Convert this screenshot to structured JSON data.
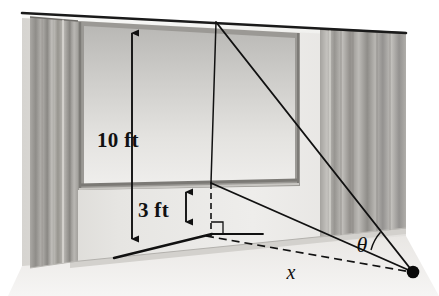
{
  "figure": {
    "background_color": "#ffffff",
    "width": 439,
    "height": 296
  },
  "labels": {
    "top_height": "10 ft",
    "bottom_height": "3 ft",
    "horizontal_distance": "x",
    "angle": "θ"
  },
  "colors": {
    "ink": "#111111",
    "wall_light": "#f1f0ee",
    "wall_mid": "#dcdad6",
    "screen_light": "#e8e7e4",
    "screen_dark": "#bcbbb8",
    "frame": "#8e8c88",
    "curtain_light": "#cdcbc7",
    "curtain_dark": "#9a9894",
    "floor": "#e4e2df",
    "baseboard": "#cfcdc9"
  },
  "geometry": {
    "ceiling_line": {
      "x1": 22,
      "y1": 13,
      "x2": 406,
      "y2": 33
    },
    "vertex_point": {
      "cx": 413,
      "cy": 272,
      "r": 6
    },
    "screen_top_point": {
      "x": 216,
      "y": 22
    },
    "screen_bottom_point": {
      "x": 211,
      "y": 183
    },
    "foot_point": {
      "x": 211,
      "y": 234
    },
    "height_arrow_10ft": {
      "x": 132,
      "y_top": 25,
      "y_bottom": 247
    },
    "height_arrow_3ft": {
      "x": 186,
      "y_top": 184,
      "y_bottom": 230
    },
    "right_angle_marker": {
      "x": 211,
      "y": 234,
      "size": 12
    },
    "angle_arc": {
      "cx": 413,
      "cy": 272,
      "r": 44
    }
  },
  "elements": {
    "left_curtain": {
      "x": 30,
      "y": 17,
      "w": 48,
      "h": 251
    },
    "right_curtain": {
      "x": 320,
      "y": 29,
      "w": 85,
      "h": 199
    },
    "screen": {
      "x": 78,
      "y": 21,
      "w": 222,
      "h": 166
    }
  }
}
